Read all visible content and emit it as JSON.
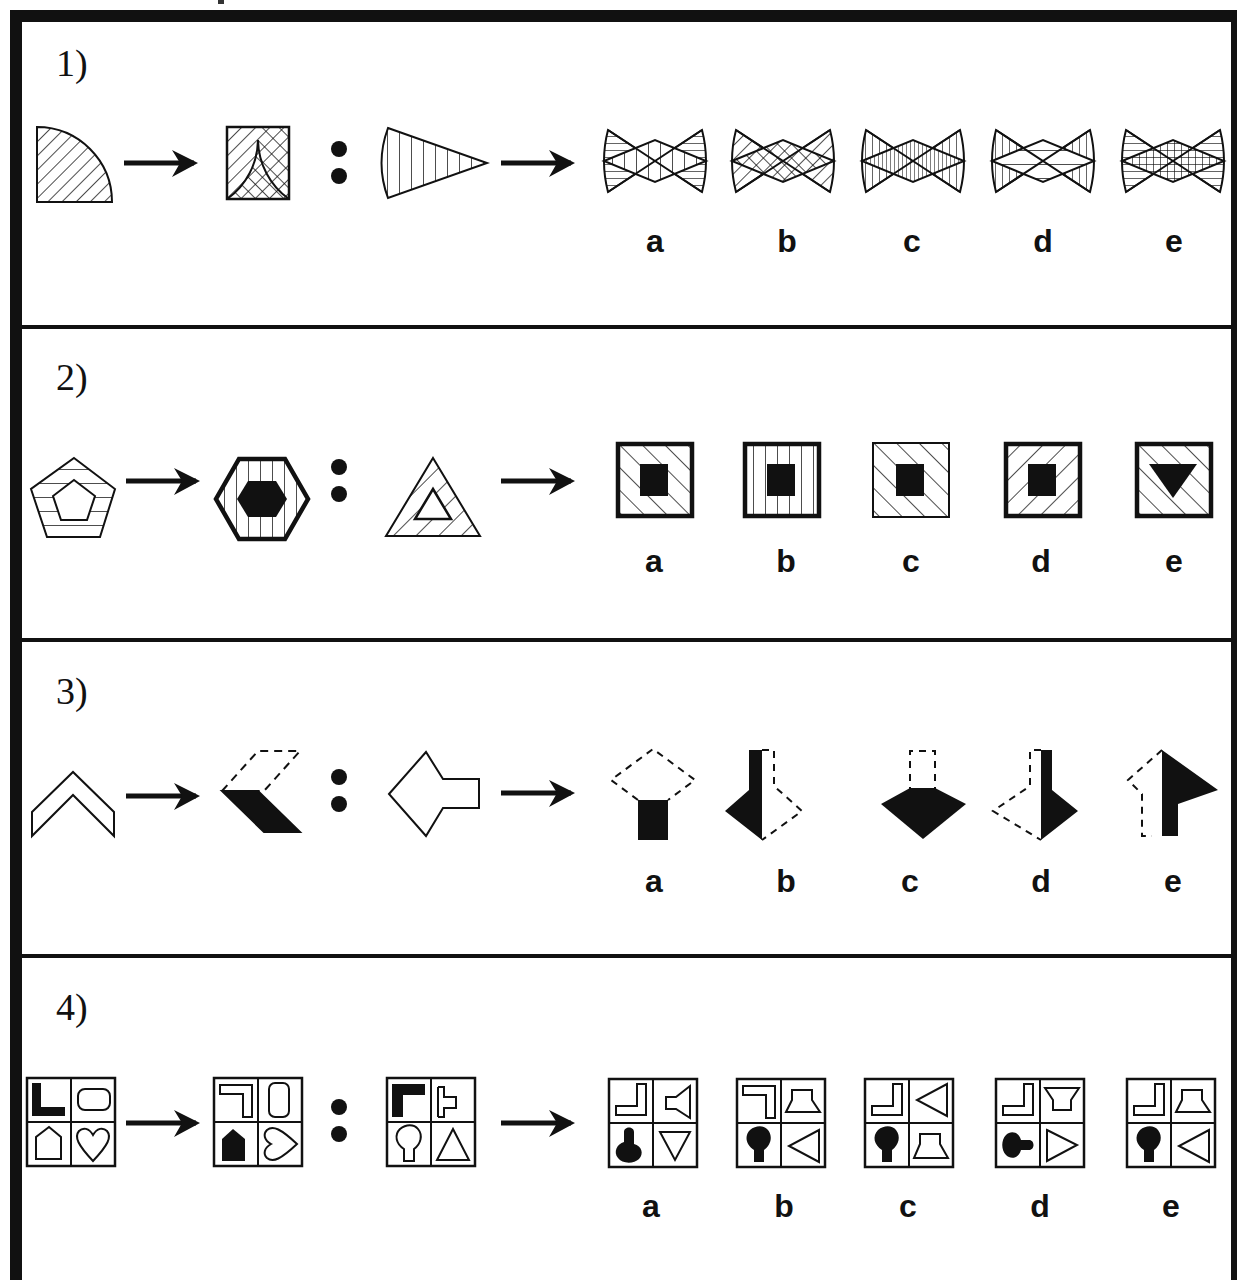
{
  "rows": [
    {
      "label": "1)",
      "question": {
        "a": "quarter-circle with diagonal hatching",
        "b": "square with two overlapping quarter-arcs, crosshatched lens",
        "c": "triangle with curved base, vertical hatching"
      },
      "options": [
        {
          "label": "a",
          "description": "bowtie, horizontal hatch wings, vertical hatch diamond"
        },
        {
          "label": "b",
          "description": "bowtie, diagonal hatch wings, crosshatched diamond"
        },
        {
          "label": "c",
          "description": "bowtie, vertical hatch wings, dense vertical diamond"
        },
        {
          "label": "d",
          "description": "bowtie, vertical hatch wings, horizontal diamond"
        },
        {
          "label": "e",
          "description": "bowtie, horizontal hatch wings, grid diamond"
        }
      ]
    },
    {
      "label": "2)",
      "question": {
        "a": "pentagon with inner pentagon, horizontal stripes",
        "b": "bold hexagon with vertical stripes, black hexagon center",
        "c": "triangle with inner triangle, diagonal hatching"
      },
      "options": [
        {
          "label": "a",
          "description": "bold square, backslash hatch, black square"
        },
        {
          "label": "b",
          "description": "bold square, vertical stripes, black square"
        },
        {
          "label": "c",
          "description": "thin square, backslash hatch, black square"
        },
        {
          "label": "d",
          "description": "bold square, slash hatch, black square"
        },
        {
          "label": "e",
          "description": "bold square, backslash hatch, black triangle"
        }
      ]
    },
    {
      "label": "3)",
      "question": {
        "a": "outlined chevron pointing up",
        "b": "chevron split: dashed top half, black bottom half",
        "c": "outlined arrow pointing left"
      },
      "options": [
        {
          "label": "a",
          "description": "dashed diamond head, black square stem"
        },
        {
          "label": "b",
          "description": "left half black, right half dashed, arrow down"
        },
        {
          "label": "c",
          "description": "dashed stem, black diamond head"
        },
        {
          "label": "d",
          "description": "left half dashed, right half black, arrow down"
        },
        {
          "label": "e",
          "description": "left half dashed, right half black, arrow up"
        }
      ]
    },
    {
      "label": "4)",
      "question": {
        "a": "2x2 grid: black L, rounded rect, house, heart",
        "b": "2x2 grid: rotated L outline, vertical rounded rect, black house, rotated heart",
        "c": "2x2 grid: black L, speaker, keyhole, triangle"
      },
      "options": [
        {
          "label": "a"
        },
        {
          "label": "b"
        },
        {
          "label": "c"
        },
        {
          "label": "d"
        },
        {
          "label": "e"
        }
      ]
    }
  ],
  "colors": {
    "ink": "#111111",
    "paper": "#ffffff"
  }
}
